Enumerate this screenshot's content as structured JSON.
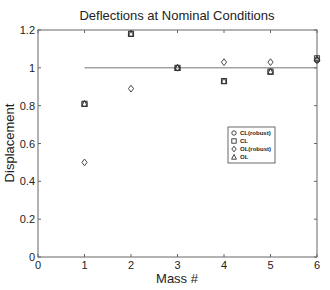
{
  "chart_data": {
    "type": "scatter",
    "title": "Deflections at Nominal Conditions",
    "xlabel": "Mass #",
    "ylabel": "Displacement",
    "xlim": [
      0,
      6
    ],
    "ylim": [
      0,
      1.2
    ],
    "xticks": [
      "0",
      "1",
      "2",
      "3",
      "4",
      "5",
      "6"
    ],
    "yticks": [
      "0",
      "0.2",
      "0.4",
      "0.6",
      "0.8",
      "1",
      "1.2"
    ],
    "grid": false,
    "legend_position": "center-right",
    "reference_line": {
      "y": 1.0,
      "x_from": 1,
      "x_to": 6
    },
    "x": [
      1,
      2,
      3,
      4,
      5,
      6
    ],
    "series": [
      {
        "name": "CL(robust)",
        "marker": "circle",
        "values": [
          0.81,
          1.18,
          1.0,
          0.93,
          0.98,
          1.04
        ]
      },
      {
        "name": "CL",
        "marker": "square",
        "values": [
          0.81,
          1.18,
          1.0,
          0.93,
          0.98,
          1.05
        ]
      },
      {
        "name": "OL(robust)",
        "marker": "diamond",
        "values": [
          0.5,
          0.89,
          1.0,
          1.03,
          1.03,
          1.04
        ]
      },
      {
        "name": "OL",
        "marker": "triangle",
        "values": [
          0.81,
          1.18,
          1.0,
          0.93,
          0.98,
          1.05
        ]
      }
    ]
  }
}
